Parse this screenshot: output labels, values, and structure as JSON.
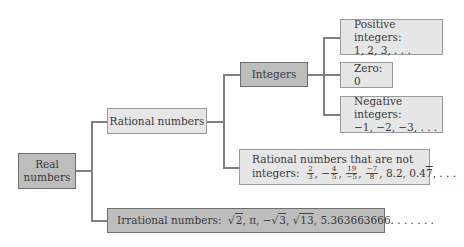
{
  "diagram": {
    "nodes": {
      "real": {
        "line1": "Real",
        "line2": "numbers"
      },
      "rational": {
        "label": "Rational numbers"
      },
      "integers": {
        "label": "Integers"
      },
      "positive": {
        "line1": "Positive integers:",
        "line2": "1, 2, 3, . . ."
      },
      "zero": {
        "label": "Zero: 0"
      },
      "negative": {
        "line1": "Negative integers:",
        "line2": "−1, −2, −3, . . ."
      },
      "non_integer_rational": {
        "line1": "Rational numbers that are not",
        "prefix": "integers:",
        "examples": {
          "f1_num": "2",
          "f1_den": "3",
          "f2_sign": "−",
          "f2_num": "4",
          "f2_den": "5",
          "f3_num": "19",
          "f3_den": "−5",
          "f4_num": "−7",
          "f4_den": "8",
          "dec1": "8.2",
          "dec2_base": "0.4",
          "dec2_repeat": "7",
          "ellipsis": ", . . ."
        }
      },
      "irrational": {
        "prefix": "Irrational numbers:",
        "root1": "2",
        "pi": "π",
        "neg_sign": "−",
        "root2": "3",
        "root3": "13",
        "decimal": "5.363663666. . . . . . ."
      }
    },
    "edges": [
      {
        "from": "real",
        "to": "rational"
      },
      {
        "from": "real",
        "to": "irrational"
      },
      {
        "from": "rational",
        "to": "integers"
      },
      {
        "from": "rational",
        "to": "non_integer_rational"
      },
      {
        "from": "integers",
        "to": "positive"
      },
      {
        "from": "integers",
        "to": "zero"
      },
      {
        "from": "integers",
        "to": "negative"
      }
    ],
    "colors": {
      "light_fill": "#e6e6e6",
      "dark_fill": "#bdbdbd",
      "line": "#808080"
    }
  }
}
